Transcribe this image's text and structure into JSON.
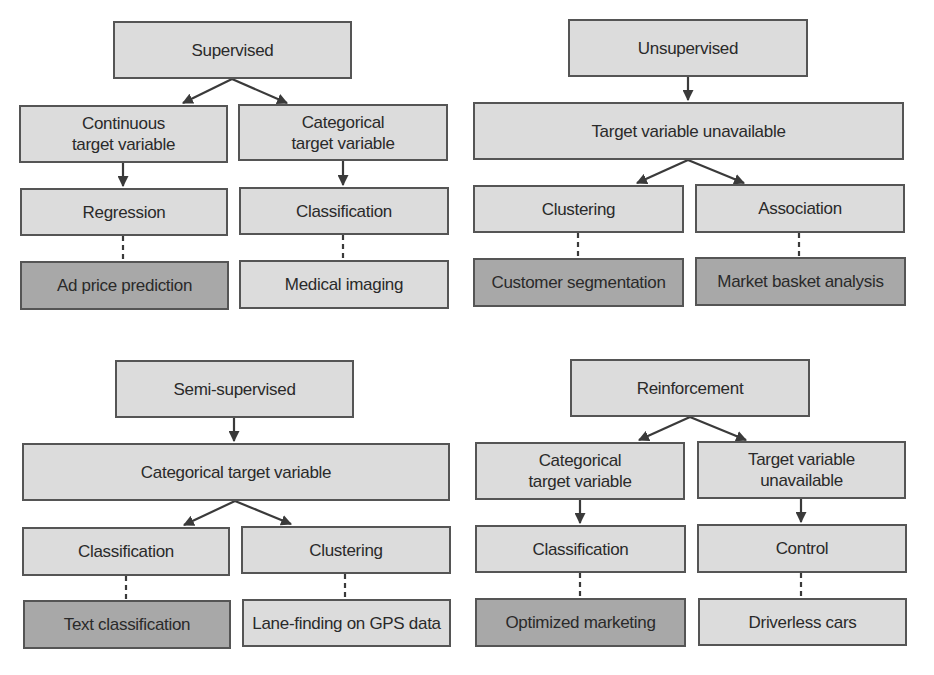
{
  "colors": {
    "light_fill": "#dcdcdc",
    "dark_fill": "#a8a8a8",
    "border": "#555555",
    "text": "#2a2a2a",
    "connector": "#3a3a3a"
  },
  "diagrams": [
    {
      "name": "supervised",
      "root": "Supervised",
      "level2": [
        "Continuous\ntarget variable",
        "Categorical\ntarget variable"
      ],
      "level3": [
        "Regression",
        "Classification"
      ],
      "examples": [
        {
          "label": "Ad price prediction",
          "shade": "dark"
        },
        {
          "label": "Medical imaging",
          "shade": "light"
        }
      ]
    },
    {
      "name": "unsupervised",
      "root": "Unsupervised",
      "shared": "Target variable unavailable",
      "level3": [
        "Clustering",
        "Association"
      ],
      "examples": [
        {
          "label": "Customer segmentation",
          "shade": "dark"
        },
        {
          "label": "Market basket analysis",
          "shade": "dark"
        }
      ]
    },
    {
      "name": "semi-supervised",
      "root": "Semi-supervised",
      "shared": "Categorical target variable",
      "level3": [
        "Classification",
        "Clustering"
      ],
      "examples": [
        {
          "label": "Text classification",
          "shade": "dark"
        },
        {
          "label": "Lane-finding on GPS data",
          "shade": "light"
        }
      ]
    },
    {
      "name": "reinforcement",
      "root": "Reinforcement",
      "level2": [
        "Categorical\ntarget variable",
        "Target variable\nunavailable"
      ],
      "level3": [
        "Classification",
        "Control"
      ],
      "examples": [
        {
          "label": "Optimized marketing",
          "shade": "dark"
        },
        {
          "label": "Driverless cars",
          "shade": "light"
        }
      ]
    }
  ]
}
